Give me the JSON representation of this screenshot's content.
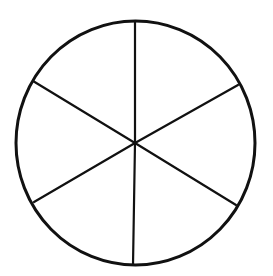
{
  "diagram": {
    "type": "circle-divided-into-sectors",
    "sector_count": 6,
    "stroke_color": "#111111",
    "background_color": "#ffffff",
    "circle": {
      "cx": 135.5,
      "cy": 143,
      "rx": 119.5,
      "ry": 122
    },
    "spoke_endpoints": [
      {
        "x": 135,
        "y": 21
      },
      {
        "x": 238,
        "y": 85
      },
      {
        "x": 236,
        "y": 205
      },
      {
        "x": 133,
        "y": 265
      },
      {
        "x": 34,
        "y": 202
      },
      {
        "x": 33,
        "y": 81
      }
    ],
    "center": {
      "x": 135,
      "y": 143
    }
  }
}
